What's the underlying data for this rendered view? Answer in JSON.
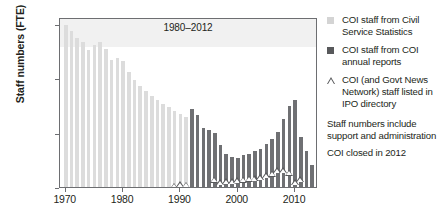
{
  "chart_data": {
    "type": "bar",
    "title": "",
    "annotation": "1980–2012",
    "xlabel": "",
    "ylabel": "Staff numbers (FTE)",
    "xlim": [
      1969,
      2014
    ],
    "ylim": [
      0,
      1560
    ],
    "grid": false,
    "legend_position": "right",
    "xticks": [
      "1970",
      "1980",
      "1990",
      "2000",
      "2010"
    ],
    "xtick_values": [
      1970,
      1980,
      1990,
      2000,
      2010
    ],
    "yticks": [
      "0",
      "500",
      "1000",
      "1500"
    ],
    "ytick_values": [
      0,
      500,
      1000,
      1500
    ],
    "series": [
      {
        "name": "COI staff from Civil Service Statistics",
        "type": "bar",
        "color": "#dcdcdc",
        "x": [
          1970,
          1971,
          1972,
          1973,
          1974,
          1975,
          1976,
          1977,
          1978,
          1979,
          1980,
          1981,
          1982,
          1983,
          1984,
          1985,
          1986,
          1987,
          1988,
          1989,
          1990,
          1991,
          1992,
          1993,
          1994,
          1995,
          1996
        ],
        "values": [
          1490,
          1435,
          1370,
          1330,
          1255,
          1300,
          1335,
          1265,
          1165,
          1180,
          1155,
          1055,
          985,
          930,
          885,
          835,
          800,
          760,
          735,
          700,
          670,
          640,
          610,
          575,
          545,
          520,
          495
        ]
      },
      {
        "name": "COI staff from COI annual reports",
        "type": "bar",
        "color": "#6f7073",
        "x": [
          1992,
          1993,
          1994,
          1995,
          1996,
          1997,
          1998,
          1999,
          2000,
          2001,
          2002,
          2003,
          2004,
          2005,
          2006,
          2007,
          2008,
          2009,
          2010,
          2011,
          2012,
          2013
        ],
        "values": [
          715,
          660,
          545,
          525,
          495,
          390,
          305,
          275,
          270,
          290,
          300,
          330,
          345,
          395,
          440,
          505,
          620,
          740,
          800,
          460,
          330,
          200
        ]
      },
      {
        "name": "COI (and Govt News Network) staff listed in IPO directory",
        "type": "scatter",
        "marker": "open-triangle",
        "color": "#58595b",
        "x": [
          1978,
          1981,
          1989,
          1990,
          1991,
          1996,
          1997,
          1998,
          1999,
          2000,
          2001,
          2002,
          2003,
          2004,
          2005,
          2006,
          2007,
          2008,
          2009,
          2010,
          2011,
          2013
        ],
        "values": [
          20,
          30,
          70,
          85,
          80,
          125,
          105,
          110,
          110,
          120,
          125,
          135,
          140,
          150,
          165,
          180,
          215,
          210,
          190,
          105,
          130,
          10
        ]
      }
    ]
  },
  "legend": {
    "items": [
      {
        "marker": "light-square",
        "label": "COI staff from Civil Service Statistics"
      },
      {
        "marker": "dark-square",
        "label": "COI staff from COI annual reports"
      },
      {
        "marker": "open-triangle",
        "label": "COI (and Govt News Network) staff listed in IPO directory"
      }
    ],
    "notes": [
      "Staff numbers include support and administration",
      "COI closed  in 2012"
    ]
  }
}
